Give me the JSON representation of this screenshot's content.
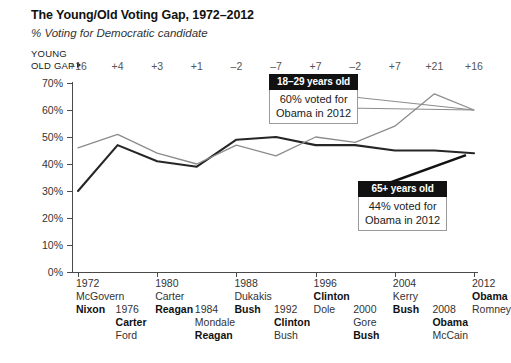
{
  "header": {
    "title": "The Young/Old Voting Gap, 1972–2012",
    "subtitle": "% Voting for Democratic candidate"
  },
  "gap_row": {
    "label_line1": "YOUNG",
    "label_line2": "OLD GAP",
    "values": [
      "+16",
      "+4",
      "+3",
      "+1",
      "–2",
      "–7",
      "+7",
      "–2",
      "+7",
      "+21",
      "+16"
    ]
  },
  "callouts": {
    "young": {
      "header": "18–29 years old",
      "line1": "60% voted for",
      "line2": "Obama in 2012"
    },
    "old": {
      "header": "65+ years old",
      "line1": "44% voted for",
      "line2": "Obama in 2012"
    }
  },
  "elections": [
    {
      "year": "1972",
      "loser": "McGovern",
      "winner": "Nixon"
    },
    {
      "year": "1976",
      "winner": "Carter",
      "loser": "Ford"
    },
    {
      "year": "1980",
      "loser": "Carter",
      "winner": "Reagan"
    },
    {
      "year": "1984",
      "loser": "Mondale",
      "winner": "Reagan"
    },
    {
      "year": "1988",
      "loser": "Dukakis",
      "winner": "Bush"
    },
    {
      "year": "1992",
      "winner": "Clinton",
      "loser": "Bush"
    },
    {
      "year": "1996",
      "winner": "Clinton",
      "loser": "Dole"
    },
    {
      "year": "2000",
      "loser": "Gore",
      "winner": "Bush"
    },
    {
      "year": "2004",
      "loser": "Kerry",
      "winner": "Bush"
    },
    {
      "year": "2008",
      "winner": "Obama",
      "loser": "McCain"
    },
    {
      "year": "2012",
      "winner": "Obama",
      "loser": "Romney"
    }
  ],
  "colors": {
    "young_line": "#8c8c8c",
    "old_line": "#262626",
    "axis": "#4a4a4a",
    "callout_header_bg": "#111111",
    "background": "#ffffff"
  },
  "chart_data": {
    "type": "line",
    "title": "The Young/Old Voting Gap, 1972–2012",
    "subtitle": "% Voting for Democratic candidate",
    "xlabel": "",
    "ylabel": "% Voting for Democratic candidate",
    "ylim": [
      0,
      70
    ],
    "yticks": [
      0,
      10,
      20,
      30,
      40,
      50,
      60,
      70
    ],
    "ytick_labels": [
      "0%",
      "10%",
      "20%",
      "30%",
      "40%",
      "50%",
      "60%",
      "70%"
    ],
    "grid": false,
    "legend": "annotated-callouts",
    "categories": [
      1972,
      1976,
      1980,
      1984,
      1988,
      1992,
      1996,
      2000,
      2004,
      2008,
      2012
    ],
    "series": [
      {
        "name": "18–29 years old",
        "color": "#8c8c8c",
        "values": [
          46,
          51,
          44,
          40,
          47,
          43,
          50,
          48,
          54,
          66,
          60
        ]
      },
      {
        "name": "65+ years old",
        "color": "#262626",
        "values": [
          30,
          47,
          41,
          39,
          49,
          50,
          47,
          47,
          45,
          45,
          44
        ]
      }
    ],
    "gap_young_minus_old": [
      16,
      4,
      3,
      1,
      -2,
      -7,
      7,
      -2,
      7,
      21,
      16
    ],
    "annotations": [
      {
        "text": "18–29 years old / 60% voted for Obama in 2012",
        "target_year": 2012,
        "target_value": 60
      },
      {
        "text": "65+ years old / 44% voted for Obama in 2012",
        "target_year": 2012,
        "target_value": 44
      }
    ]
  }
}
